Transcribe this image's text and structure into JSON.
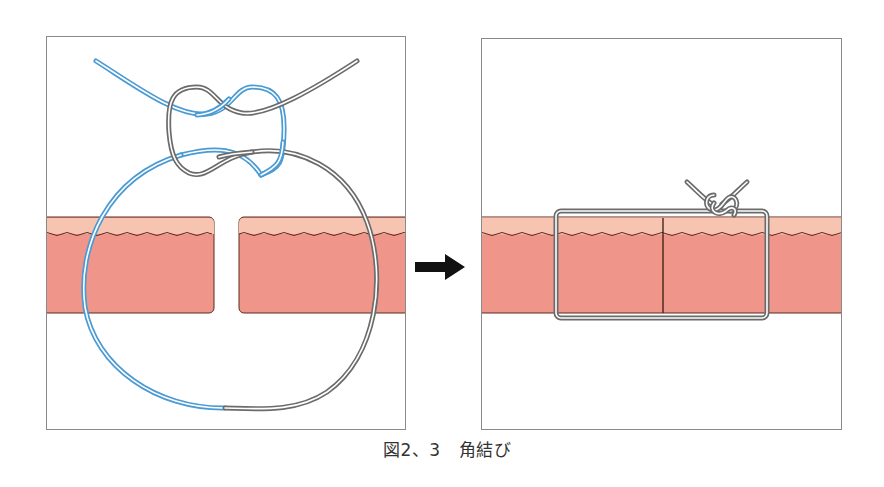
{
  "figure": {
    "caption_label": "図2、3",
    "caption_title": "角結び"
  },
  "colors": {
    "epidermis": "#f6c4b0",
    "dermis": "#f0958a",
    "skin_outline": "#5a2a22",
    "suture_blue": "#4a9ad4",
    "suture_gray": "#6b6b6b",
    "panel_border": "#8a8a8a",
    "arrow": "#111111"
  },
  "panels": [
    {
      "name": "before",
      "description": "Loose suture loop through separated wound edges with square knot"
    },
    {
      "name": "after",
      "description": "Suture tied, wound edges approximated with knot on top"
    }
  ],
  "arrow": {
    "direction": "right"
  }
}
